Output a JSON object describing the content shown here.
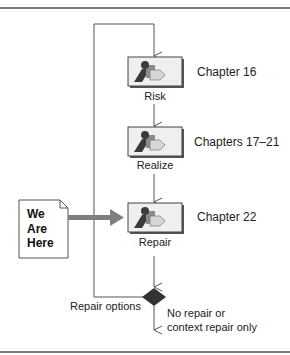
{
  "diagram": {
    "steps": [
      {
        "label": "Risk",
        "chapter": "Chapter 16",
        "icon": "process-icon"
      },
      {
        "label": "Realize",
        "chapter": "Chapters 17–21",
        "icon": "process-icon"
      },
      {
        "label": "Repair",
        "chapter": "Chapter 22",
        "icon": "process-icon"
      }
    ],
    "note": {
      "lines": [
        "We",
        "Are",
        "Here"
      ],
      "icon": "document-note-icon"
    },
    "decision": {
      "loop_label": "Repair options",
      "exit_label_line1": "No repair or",
      "exit_label_line2": "context repair only",
      "icon": "decision-diamond-icon"
    },
    "colors": {
      "line": "#555555",
      "arrow_fill": "#7f7f7f",
      "box_fill": "#efefef",
      "icon_dark": "#3a3a3a",
      "icon_mid": "#8c8c8c",
      "icon_light": "#d6d6d6",
      "diamond": "#333333"
    }
  }
}
